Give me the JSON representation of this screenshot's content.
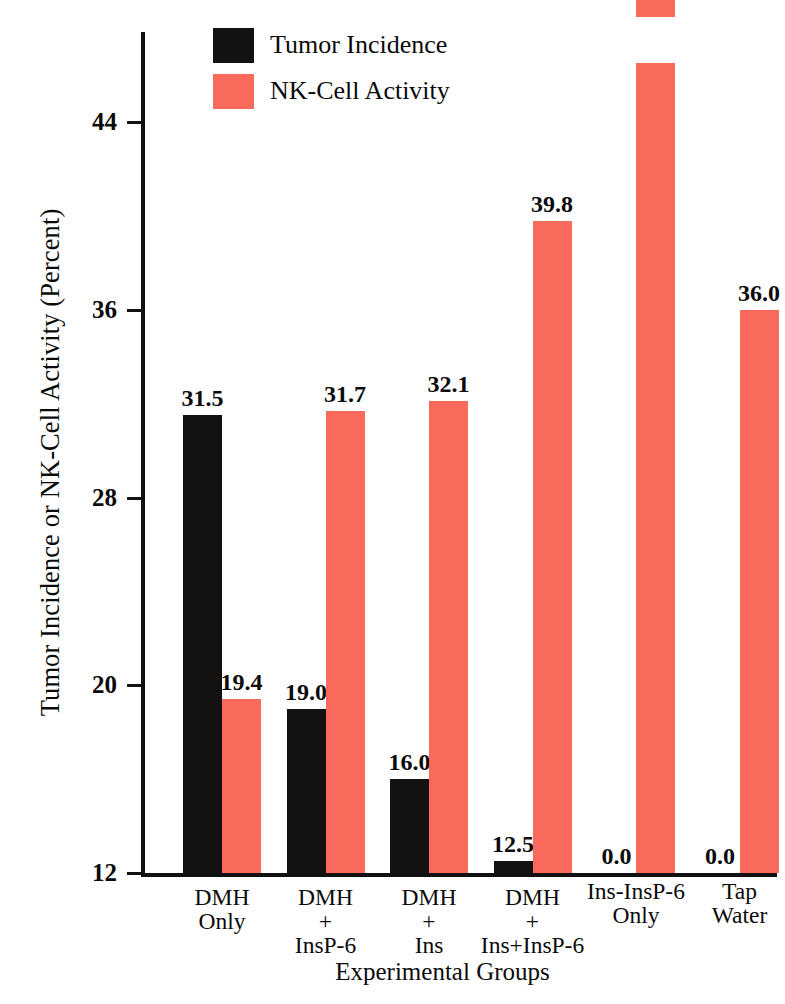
{
  "chart_data": {
    "type": "bar",
    "title": "",
    "xlabel": "Experimental Groups",
    "ylabel": "Tumor Incidence or NK-Cell Activity (Percent)",
    "ylim": [
      12,
      50
    ],
    "yticks": [
      12,
      20,
      28,
      36,
      44
    ],
    "grid": false,
    "legend_position": "top-center",
    "axis_break": {
      "series": "NK-Cell Activity",
      "category": "Ins-InsP-6 Only",
      "note": "diagonal white slash on bar indicating truncated axis"
    },
    "categories": [
      "DMH Only",
      "DMH + InsP-6",
      "DMH + Ins",
      "DMH + Ins+InsP-6",
      "Ins-InsP-6 Only",
      "Tap Water"
    ],
    "category_lines": [
      [
        "DMH",
        "Only",
        ""
      ],
      [
        "DMH",
        "+",
        "InsP-6"
      ],
      [
        "DMH",
        "+",
        "Ins"
      ],
      [
        "DMH",
        "+",
        "Ins+InsP-6"
      ],
      [
        "Ins-InsP-6",
        "Only",
        ""
      ],
      [
        "Tap",
        "Water",
        ""
      ]
    ],
    "series": [
      {
        "name": "Tumor Incidence",
        "color": "#141210",
        "values": [
          31.5,
          19.0,
          16.0,
          12.5,
          0.0,
          0.0
        ],
        "labels": [
          "31.5",
          "19.0",
          "16.0",
          "12.5",
          "0.0",
          "0.0"
        ]
      },
      {
        "name": "NK-Cell Activity",
        "color": "#fa6a5a",
        "values": [
          19.4,
          31.7,
          32.1,
          39.8,
          49.4,
          36.0
        ],
        "labels": [
          "19.4",
          "31.7",
          "32.1",
          "39.8",
          "49.4",
          "36.0"
        ]
      }
    ]
  },
  "legend": {
    "items": [
      {
        "label": "Tumor Incidence",
        "color": "#141210"
      },
      {
        "label": "NK-Cell Activity",
        "color": "#fa6a5a"
      }
    ]
  },
  "axis": {
    "y_title": "Tumor Incidence or NK-Cell Activity (Percent)",
    "x_title": "Experimental Groups",
    "y_tick_labels": [
      "44",
      "36",
      "28",
      "20",
      "12"
    ]
  }
}
